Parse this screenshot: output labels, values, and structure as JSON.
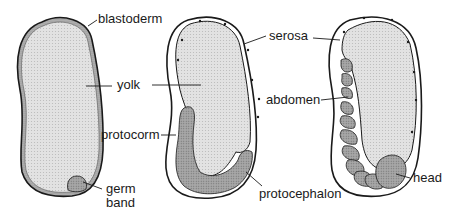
{
  "figure": {
    "stages": [
      {
        "id": "stage-1",
        "labels": {
          "blastoderm": "blastoderm",
          "yolk": "yolk",
          "germ_band_line1": "germ",
          "germ_band_line2": "band"
        }
      },
      {
        "id": "stage-2",
        "labels": {
          "serosa": "serosa",
          "protocorm": "protocorm",
          "protocephalon": "protocephalon"
        }
      },
      {
        "id": "stage-3",
        "labels": {
          "abdomen": "abdomen",
          "head": "head"
        }
      }
    ]
  },
  "colors": {
    "outline": "#1a1a1a",
    "yolk_fill": "#dcdcdc",
    "embryo_fill": "#9a9a9a",
    "background": "#ffffff"
  }
}
